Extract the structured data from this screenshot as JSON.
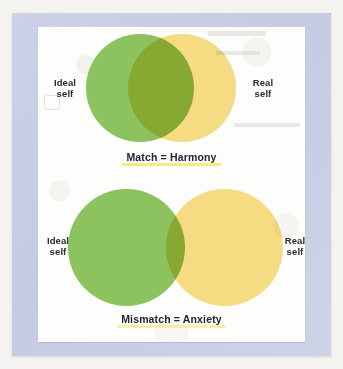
{
  "figure": {
    "diagrams": [
      {
        "id": "harmony",
        "left_label": "Ideal\nself",
        "right_label": "Real\nself",
        "caption": "Match = Harmony",
        "left_circle_color": "#8cc35f",
        "right_circle_color": "#f7dd84",
        "overlap_color": "#bfd183",
        "overlap": "large",
        "highlight_color": "#f5e86a"
      },
      {
        "id": "anxiety",
        "left_label": "Ideal\nself",
        "right_label": "Real\nself",
        "caption": "Mismatch = Anxiety",
        "left_circle_color": "#8cc35f",
        "right_circle_color": "#f7dd84",
        "overlap_color": "#bfd183",
        "overlap": "small",
        "highlight_color": "#f5e86a"
      }
    ],
    "frame_color": "#c9cfe6",
    "sheet_color": "#fdfdfb",
    "page_color": "#f4f3ef"
  }
}
